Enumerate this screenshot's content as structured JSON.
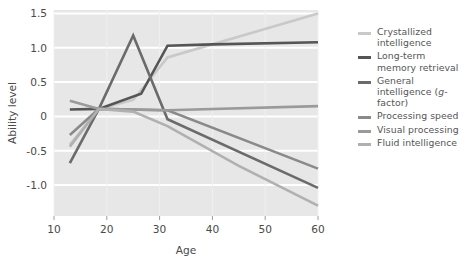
{
  "chart_data": {
    "type": "line",
    "title": "",
    "xlabel": "Age",
    "ylabel": "Ability level",
    "xlim": [
      10,
      60
    ],
    "ylim": [
      -1.45,
      1.55
    ],
    "xticks": [
      10,
      20,
      30,
      40,
      50,
      60
    ],
    "xticklabels": [
      "10",
      "20",
      "30",
      "40",
      "50",
      "60"
    ],
    "yticks": [
      1.5,
      1.0,
      0.5,
      0,
      -0.5,
      -1.0
    ],
    "yticklabels": [
      "1.5",
      "1.0",
      "0.5",
      "0",
      "-0.5",
      "-1.0"
    ],
    "grid": "horizontal-white-on-gray",
    "legend_position": "right",
    "plot_background": "#e7e7e7",
    "gridline_color": "#ffffff",
    "series": [
      {
        "name": "Crystallized intelligence",
        "color": "#c9c9c9",
        "x": [
          13,
          18.5,
          25,
          31.5,
          60
        ],
        "y": [
          -0.41,
          0.11,
          0.24,
          0.86,
          1.5
        ]
      },
      {
        "name": "Long-term memory retrieval",
        "color": "#555555",
        "x": [
          13,
          18.5,
          26.5,
          31.5,
          40,
          60
        ],
        "y": [
          0.1,
          0.11,
          0.33,
          1.03,
          1.05,
          1.08
        ]
      },
      {
        "name": "General intelligence (g-factor)",
        "color": "#6b6b6b",
        "x": [
          13,
          18.5,
          25,
          31.5,
          60
        ],
        "y": [
          -0.68,
          0.11,
          1.18,
          -0.04,
          -1.04
        ]
      },
      {
        "name": "Processing speed",
        "color": "#8a8a8a",
        "x": [
          13,
          18.5,
          31.5,
          60
        ],
        "y": [
          -0.27,
          0.11,
          0.09,
          -0.76
        ]
      },
      {
        "name": "Visual processing",
        "color": "#9a9a9a",
        "x": [
          13,
          18.5,
          31.5,
          60
        ],
        "y": [
          0.23,
          0.11,
          0.09,
          0.15
        ]
      },
      {
        "name": "Fluid intelligence",
        "color": "#b0b0b0",
        "x": [
          13,
          18.5,
          25,
          31.5,
          45,
          60
        ],
        "y": [
          -0.44,
          0.11,
          0.07,
          -0.14,
          -0.72,
          -1.3
        ]
      }
    ]
  },
  "legend": {
    "items": [
      {
        "label": "Crystallized intelligence",
        "color": "#c9c9c9",
        "italic_part": ""
      },
      {
        "label": "Long-term memory retrieval",
        "color": "#555555",
        "italic_part": ""
      },
      {
        "label": "General intelligence (g-factor)",
        "color": "#6b6b6b",
        "italic_part": "g"
      },
      {
        "label": "Processing speed",
        "color": "#8a8a8a",
        "italic_part": ""
      },
      {
        "label": "Visual processing",
        "color": "#9a9a9a",
        "italic_part": ""
      },
      {
        "label": "Fluid intelligence",
        "color": "#b0b0b0",
        "italic_part": ""
      }
    ]
  }
}
